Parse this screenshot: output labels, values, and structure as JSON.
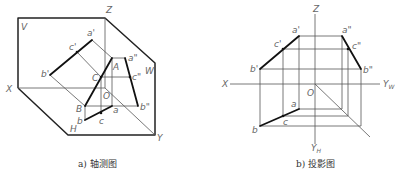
{
  "figures": [
    {
      "id": "a",
      "caption": "a) 轴测图",
      "labels": {
        "V": "V",
        "Z": "Z",
        "W": "W",
        "X": "X",
        "H": "H",
        "Y": "Y",
        "O": "O",
        "a_prime": "a'",
        "b_prime": "b'",
        "c_prime": "c'",
        "a_dbl": "a\"",
        "b_dbl": "b\"",
        "c_dbl": "c\"",
        "A": "A",
        "B": "B",
        "C": "C",
        "a": "a",
        "b": "b",
        "c": "c"
      }
    },
    {
      "id": "b",
      "caption": "b) 投影图",
      "labels": {
        "Z": "Z",
        "X": "X",
        "O": "O",
        "Y_W": "Y",
        "Y_W_sub": "W",
        "Y_H": "Y",
        "Y_H_sub": "H",
        "a_prime": "a'",
        "b_prime": "b'",
        "c_prime": "c'",
        "a_dbl": "a\"",
        "b_dbl": "b\"",
        "c_dbl": "c\"",
        "a": "a",
        "b": "b",
        "c": "c"
      }
    }
  ]
}
